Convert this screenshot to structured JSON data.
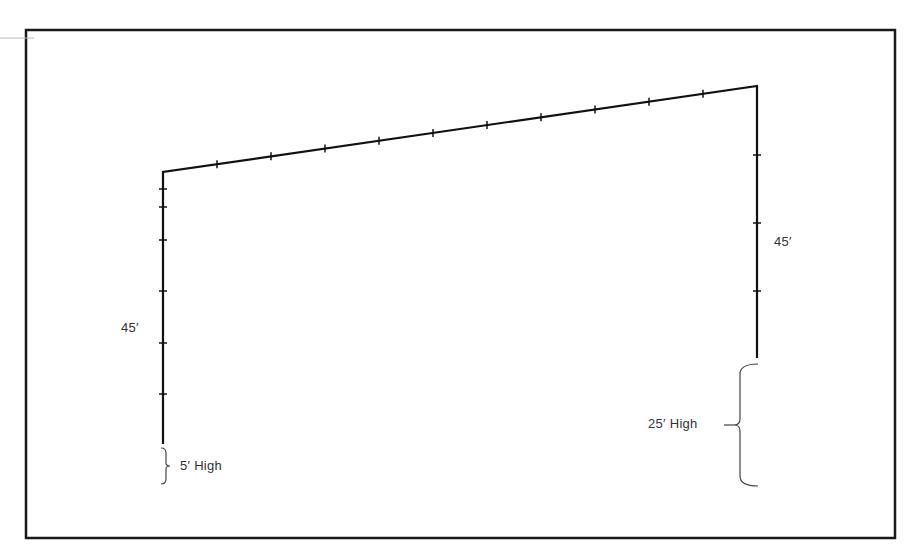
{
  "diagram": {
    "type": "fence-elevation-layout",
    "frame": {
      "x": 26,
      "y": 30,
      "width": 869,
      "height": 508,
      "stroke": "#1a1a1a"
    },
    "line_color": "#111111",
    "text_color": "#333333",
    "fence_path": {
      "left_wall": {
        "x": 163,
        "y_top": 172,
        "y_bottom": 444
      },
      "roof": {
        "x1": 163,
        "y1": 172,
        "x2": 757,
        "y2": 86
      },
      "right_wall": {
        "x": 757,
        "y_top": 86,
        "y_bottom": 358
      }
    },
    "ticks": {
      "roof_x": [
        217,
        271,
        325,
        379,
        433,
        487,
        541,
        595,
        649,
        703
      ],
      "left_wall_y": [
        189,
        207,
        240,
        291,
        343,
        394
      ],
      "right_wall_y": [
        155,
        223,
        291
      ]
    },
    "labels": {
      "left_length": "45′",
      "right_length": "45′",
      "left_height": "5′ High",
      "right_height": "25′ High"
    },
    "braces": {
      "left": {
        "x": 163,
        "y_top": 448,
        "y_bottom": 484
      },
      "right": {
        "x": 740,
        "y_top": 364,
        "y_bottom": 486
      }
    }
  }
}
